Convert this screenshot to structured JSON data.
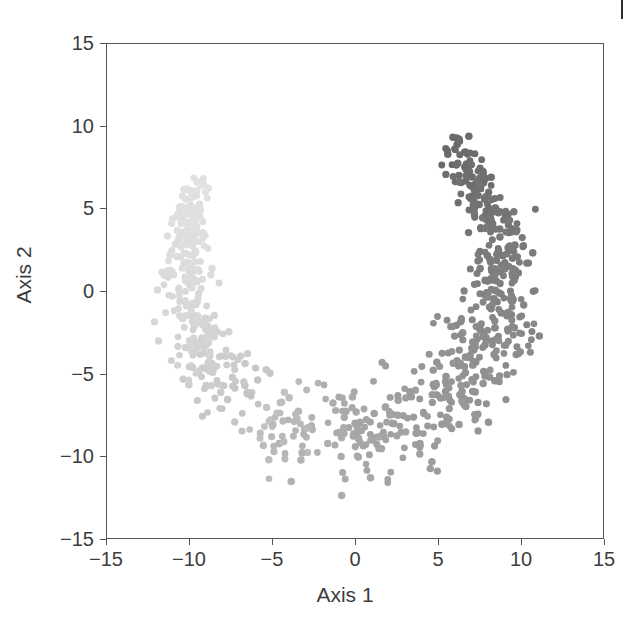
{
  "figure": {
    "background": "#ffffff",
    "frame_color": "#555555",
    "scan_mark": "page-edge-artifact"
  },
  "chart_data": {
    "type": "scatter",
    "title": "",
    "subtitle": "",
    "xlabel": "Axis 1",
    "ylabel": "Axis 2",
    "xlim": [
      -15,
      15
    ],
    "ylim": [
      -15,
      15
    ],
    "xticks": [
      -15,
      -10,
      -5,
      0,
      5,
      10,
      15
    ],
    "yticks": [
      -15,
      -10,
      -5,
      0,
      5,
      10,
      15
    ],
    "xticklabels": [
      "−15",
      "−10",
      "−5",
      "0",
      "5",
      "10",
      "15"
    ],
    "yticklabels": [
      "−15",
      "−10",
      "−5",
      "0",
      "5",
      "10",
      "15"
    ],
    "grid": false,
    "legend": "none",
    "legend_position": "none",
    "marker": "circle",
    "marker_size_px": 7,
    "n_points_total": 900,
    "shape_description": "horseshoe / U-shaped one-dimensional manifold, continuously shaded from light gray at the upper-left arm through mid gray along the bottom to dark gray on the upper-right arm",
    "series": [
      {
        "name": "left-arm-light",
        "color": "#dcdcdc",
        "count": 300,
        "arc_degrees": [
          150,
          250
        ],
        "points": [
          [
            -6.6,
            10.4
          ],
          [
            -7.2,
            9.9
          ],
          [
            -6.8,
            9.2
          ],
          [
            -7.6,
            9.5
          ],
          [
            -6.2,
            9.7
          ],
          [
            -8.0,
            8.6
          ],
          [
            -7.4,
            8.1
          ],
          [
            -6.9,
            8.4
          ],
          [
            -8.6,
            7.2
          ],
          [
            -8.2,
            6.6
          ],
          [
            -9.0,
            5.9
          ],
          [
            -8.7,
            5.2
          ],
          [
            -9.4,
            4.5
          ],
          [
            -9.1,
            3.9
          ],
          [
            -9.6,
            3.2
          ],
          [
            -9.3,
            2.5
          ],
          [
            -9.8,
            1.8
          ],
          [
            -9.5,
            1.1
          ],
          [
            -10.0,
            0.4
          ],
          [
            -9.7,
            -0.3
          ],
          [
            -9.9,
            -1.1
          ],
          [
            -9.6,
            -1.8
          ],
          [
            -9.4,
            -2.5
          ],
          [
            -9.0,
            -3.2
          ],
          [
            -8.6,
            -3.9
          ]
        ]
      },
      {
        "name": "bottom-arc-mid",
        "color": "#9a9a9a",
        "count": 300,
        "arc_degrees": [
          250,
          300
        ],
        "points": [
          [
            -8.2,
            -4.6
          ],
          [
            -7.7,
            -5.3
          ],
          [
            -7.1,
            -6.0
          ],
          [
            -6.4,
            -6.7
          ],
          [
            -5.7,
            -7.3
          ],
          [
            -4.9,
            -7.9
          ],
          [
            -4.0,
            -8.4
          ],
          [
            -3.1,
            -8.9
          ],
          [
            -2.2,
            -9.2
          ],
          [
            -1.3,
            -9.5
          ],
          [
            -0.4,
            -9.7
          ],
          [
            0.5,
            -9.8
          ],
          [
            1.4,
            -9.9
          ],
          [
            2.3,
            -9.8
          ],
          [
            3.2,
            -9.6
          ],
          [
            4.1,
            -9.3
          ],
          [
            5.0,
            -8.9
          ],
          [
            5.8,
            -8.4
          ],
          [
            6.5,
            -7.8
          ],
          [
            7.1,
            -7.1
          ]
        ]
      },
      {
        "name": "right-arm-dark",
        "color": "#6f6f6f",
        "count": 300,
        "arc_degrees": [
          300,
          390
        ],
        "points": [
          [
            7.7,
            -6.3
          ],
          [
            8.2,
            -5.5
          ],
          [
            8.5,
            -4.6
          ],
          [
            8.7,
            -3.7
          ],
          [
            8.8,
            -2.8
          ],
          [
            8.8,
            -1.9
          ],
          [
            8.7,
            -1.0
          ],
          [
            8.5,
            -0.1
          ],
          [
            8.2,
            0.8
          ],
          [
            7.9,
            1.7
          ],
          [
            7.6,
            2.6
          ],
          [
            7.3,
            3.5
          ],
          [
            7.0,
            4.4
          ],
          [
            6.7,
            5.3
          ],
          [
            6.4,
            6.2
          ],
          [
            6.1,
            7.1
          ],
          [
            5.8,
            8.0
          ],
          [
            5.5,
            8.9
          ],
          [
            5.2,
            9.8
          ],
          [
            4.9,
            10.7
          ],
          [
            5.6,
            11.5
          ],
          [
            6.3,
            11.0
          ],
          [
            4.6,
            12.6
          ],
          [
            7.3,
            12.3
          ]
        ]
      }
    ],
    "dense_clusters": [
      {
        "label": "upper-left light knot",
        "center": [
          -6.8,
          9.4
        ],
        "color": "#e0e0e0"
      },
      {
        "label": "mid-left light knot",
        "center": [
          -9.2,
          3.9
        ],
        "color": "#d6d6d6"
      },
      {
        "label": "lower-left knot",
        "center": [
          -8.6,
          -5.6
        ],
        "color": "#b4b4b4"
      },
      {
        "label": "bottom knot",
        "center": [
          0.5,
          -9.6
        ],
        "color": "#9a9a9a"
      },
      {
        "label": "right lower knot",
        "center": [
          7.6,
          -3.5
        ],
        "color": "#808080"
      },
      {
        "label": "right mid knot",
        "center": [
          7.4,
          2.3
        ],
        "color": "#787878"
      },
      {
        "label": "upper-right dark knot",
        "center": [
          5.6,
          9.0
        ],
        "color": "#6b6b6b"
      }
    ]
  },
  "labels": {
    "xlabel": "Axis 1",
    "ylabel": "Axis 2"
  }
}
